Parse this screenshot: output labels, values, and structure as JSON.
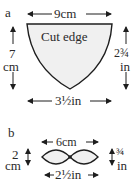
{
  "diagram": {
    "part_a": {
      "label": "a",
      "shape_text": "Cut edge",
      "top_width": "9cm",
      "left_height_value": "7",
      "left_height_unit": "cm",
      "right_height_value": "2¾",
      "right_height_unit": "in",
      "bottom_width": "3½in"
    },
    "part_b": {
      "label": "b",
      "top_width": "6cm",
      "left_height_value": "2",
      "left_height_unit": "cm",
      "right_height_value": "¾",
      "right_height_unit": "in",
      "bottom_width": "2½in"
    },
    "colors": {
      "stroke": "#1e1e1e",
      "fill": "#f0f0f0",
      "text": "#2a2a2a"
    }
  }
}
